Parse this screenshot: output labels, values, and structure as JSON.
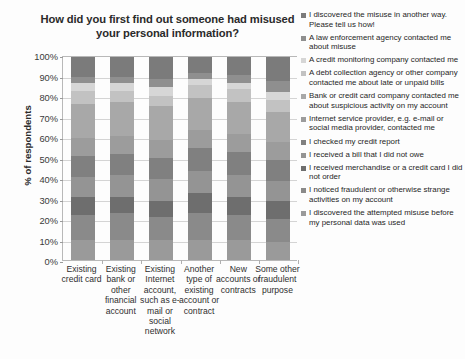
{
  "chart_data": {
    "type": "bar",
    "subtype": "stacked-percentage-column",
    "title": "How did you first find out someone had misused your personal information?",
    "xlabel": "",
    "ylabel": "% of respondents",
    "ylim": [
      0,
      100
    ],
    "ytick_labels": [
      "100%",
      "90%",
      "80%",
      "70%",
      "60%",
      "50%",
      "40%",
      "30%",
      "20%",
      "10%",
      "0%"
    ],
    "ytick_values": [
      100,
      90,
      80,
      70,
      60,
      50,
      40,
      30,
      20,
      10,
      0
    ],
    "grid": true,
    "legend_position": "right",
    "categories": [
      "Existing credit card",
      "Existing bank or other financial account",
      "Existing Internet account, such as e-mail or social network",
      "Another type of existing account or contract",
      "New accounts or contracts",
      "Some other fraudulent purpose"
    ],
    "series": [
      {
        "name": "I discovered the misuse in another way. Please tell us how!",
        "color": "#7b7b7b",
        "values": [
          10,
          10,
          11,
          8,
          9,
          12
        ]
      },
      {
        "name": "A law enforcement agency contacted me about misuse",
        "color": "#8f8f8f",
        "values": [
          3,
          3,
          4,
          3,
          4,
          5
        ]
      },
      {
        "name": "A credit monitoring company contacted me",
        "color": "#d6d6d6",
        "values": [
          4,
          4,
          4,
          3,
          3,
          4
        ]
      },
      {
        "name": "A debt collection agency or other company contacted me about late or unpaid bills",
        "color": "#c2c2c2",
        "values": [
          6,
          5,
          5,
          6,
          6,
          6
        ]
      },
      {
        "name": "Bank or credit card company contacted me about suspicious activity on my account",
        "color": "#a8a8a8",
        "values": [
          17,
          17,
          17,
          16,
          16,
          15
        ]
      },
      {
        "name": "Internet service provider, e.g. e-mail or social media provider, contacted me",
        "color": "#9c9c9c",
        "values": [
          9,
          9,
          9,
          9,
          9,
          9
        ]
      },
      {
        "name": "I checked my credit report",
        "color": "#808080",
        "values": [
          10,
          10,
          10,
          11,
          11,
          10
        ]
      },
      {
        "name": "I received a bill that I did not owe",
        "color": "#949494",
        "values": [
          10,
          11,
          11,
          11,
          11,
          10
        ]
      },
      {
        "name": "I received merchandise or a credit card I did not order",
        "color": "#6e6e6e",
        "values": [
          9,
          8,
          8,
          10,
          9,
          9
        ]
      },
      {
        "name": "I noticed fraudulent or otherwise strange activities on my account",
        "color": "#8a8a8a",
        "values": [
          12,
          13,
          11,
          13,
          12,
          11
        ]
      },
      {
        "name": "I discovered the attempted misuse before my personal data was used",
        "color": "#9a9a9a",
        "values": [
          10,
          10,
          10,
          10,
          10,
          9
        ]
      }
    ]
  }
}
